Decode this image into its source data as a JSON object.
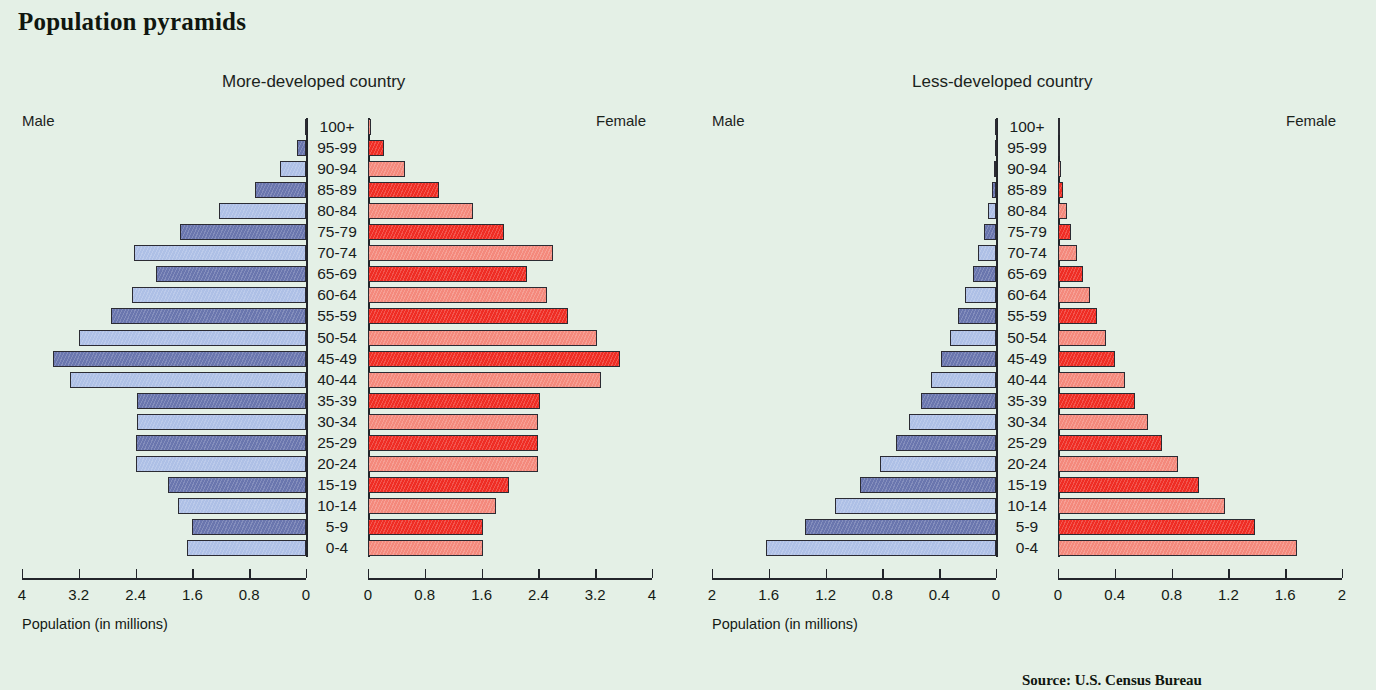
{
  "page": {
    "title": "Population pyramids"
  },
  "axis_caption": "Population (in millions)",
  "source_text": "Source: U.S. Census Bureau",
  "labels": {
    "male": "Male",
    "female": "Female",
    "age_groups": [
      "100+",
      "95-99",
      "90-94",
      "85-89",
      "80-84",
      "75-79",
      "70-74",
      "65-69",
      "60-64",
      "55-59",
      "50-54",
      "45-49",
      "40-44",
      "35-39",
      "30-34",
      "25-29",
      "20-24",
      "15-19",
      "10-14",
      "5-9",
      "0-4"
    ]
  },
  "colors": {
    "background": "#e4f0e6",
    "male_dark": "#6a76ae",
    "male_light": "#aec0e6",
    "female_dark": "#ef2d24",
    "female_light": "#f4897c",
    "axis": "#22252a"
  },
  "chart_data": [
    {
      "type": "bar",
      "title": "More-developed country",
      "xlabel": "Population (in millions)",
      "ylabel": "",
      "categories": [
        "100+",
        "95-99",
        "90-94",
        "85-89",
        "80-84",
        "75-79",
        "70-74",
        "65-69",
        "60-64",
        "55-59",
        "50-54",
        "45-49",
        "40-44",
        "35-39",
        "30-34",
        "25-29",
        "20-24",
        "15-19",
        "10-14",
        "5-9",
        "0-4"
      ],
      "xlim": [
        0,
        4
      ],
      "xticks": [
        "4",
        "3.2",
        "2.4",
        "1.6",
        "0.8",
        "0"
      ],
      "xticks_right": [
        "0",
        "0.8",
        "1.6",
        "2.4",
        "3.2",
        "4"
      ],
      "grid": false,
      "series": [
        {
          "name": "Male",
          "side": "left",
          "values": [
            0.02,
            0.13,
            0.36,
            0.72,
            1.22,
            1.78,
            2.42,
            2.11,
            2.45,
            2.75,
            3.2,
            3.56,
            3.33,
            2.38,
            2.38,
            2.4,
            2.4,
            1.95,
            1.8,
            1.6,
            1.68
          ]
        },
        {
          "name": "Female",
          "side": "right",
          "values": [
            0.04,
            0.22,
            0.52,
            1.0,
            1.48,
            1.92,
            2.6,
            2.24,
            2.52,
            2.82,
            3.22,
            3.55,
            3.28,
            2.42,
            2.4,
            2.4,
            2.4,
            1.98,
            1.8,
            1.62,
            1.62
          ]
        }
      ]
    },
    {
      "type": "bar",
      "title": "Less-developed country",
      "xlabel": "Population (in millions)",
      "ylabel": "",
      "categories": [
        "100+",
        "95-99",
        "90-94",
        "85-89",
        "80-84",
        "75-79",
        "70-74",
        "65-69",
        "60-64",
        "55-59",
        "50-54",
        "45-49",
        "40-44",
        "35-39",
        "30-34",
        "25-29",
        "20-24",
        "15-19",
        "10-14",
        "5-9",
        "0-4"
      ],
      "xlim": [
        0,
        2
      ],
      "xticks": [
        "2",
        "1.6",
        "1.2",
        "0.8",
        "0.4",
        "0"
      ],
      "xticks_right": [
        "0",
        "0.4",
        "0.8",
        "1.2",
        "1.6",
        "2"
      ],
      "grid": false,
      "series": [
        {
          "name": "Male",
          "side": "left",
          "values": [
            0.004,
            0.008,
            0.015,
            0.03,
            0.055,
            0.085,
            0.125,
            0.165,
            0.215,
            0.265,
            0.325,
            0.385,
            0.455,
            0.525,
            0.615,
            0.705,
            0.815,
            0.955,
            1.135,
            1.345,
            1.62
          ]
        },
        {
          "name": "Female",
          "side": "right",
          "values": [
            0.005,
            0.01,
            0.018,
            0.035,
            0.06,
            0.095,
            0.135,
            0.175,
            0.225,
            0.275,
            0.335,
            0.4,
            0.47,
            0.545,
            0.635,
            0.73,
            0.845,
            0.99,
            1.175,
            1.39,
            1.68
          ]
        }
      ]
    }
  ]
}
